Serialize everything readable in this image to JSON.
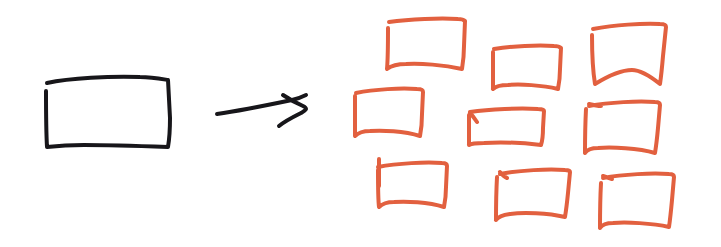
{
  "canvas": {
    "width": 721,
    "height": 247,
    "background_color": "#ffffff",
    "style": "hand-drawn-sketch",
    "title": "One box transforms into nine boxes"
  },
  "palette": {
    "ink_black": "#17161a",
    "ink_orange": "#e2603f"
  },
  "source_shape": {
    "label": "single hand-drawn rectangle",
    "color": "#17161a",
    "stroke_width": 4,
    "x": 45,
    "y": 76,
    "width": 125,
    "height": 72,
    "path": "M47 83 C70 78 110 76 140 77 C152 77 162 79 168 80 L170 118 C170 132 169 141 168 147 C140 146 104 145 84 145 C70 145 56 146 47 147 M46 91 C46 112 46 130 47 147"
  },
  "arrow": {
    "label": "transformation arrow",
    "color": "#17161a",
    "stroke_width": 4,
    "direction": "right",
    "x": 216,
    "y": 95,
    "width": 91,
    "height": 31,
    "shaft_path": "M217 114 C238 111 268 105 292 100 C297 99 302 97 306 95",
    "head_path": "M283 95 C289 99 296 103 303 106 C305 107 306 108 306 109 C306 110 304 111 301 113 C293 117 285 121 279 126"
  },
  "result_shapes": {
    "label": "nine hand-drawn rectangles",
    "color": "#e2603f",
    "stroke_width": 4,
    "count": 9,
    "grid": {
      "rows": 3,
      "columns": 3
    },
    "boxes": [
      {
        "id": "box-1",
        "row": 1,
        "column": 1,
        "x": 385,
        "y": 17,
        "width": 82,
        "height": 53,
        "path": "M389 22 C410 19 440 18 458 19 C462 19 464 20 465 21 L464 46 C464 56 463 63 462 69 C444 65 420 63 406 64 C398 64 391 66 387 69 M388 28 C388 44 388 58 387 69"
      },
      {
        "id": "box-2",
        "row": 1,
        "column": 2,
        "x": 492,
        "y": 43,
        "width": 70,
        "height": 47,
        "path": "M494 49 C512 46 538 45 554 46 C558 46 560 47 561 48 L560 69 C560 78 559 84 558 89 C542 85 520 84 508 85 C501 85 496 86 493 89 M493 52 C493 67 493 80 493 89"
      },
      {
        "id": "box-3",
        "row": 1,
        "column": 3,
        "x": 589,
        "y": 22,
        "width": 78,
        "height": 63,
        "path": "M593 29 C614 25 643 23 660 24 C664 24 666 25 666 27 L663 56 C662 68 661 77 660 84 C650 76 640 70 632 70 C622 70 608 76 595 84 M592 35 C592 55 593 72 595 84"
      },
      {
        "id": "box-4",
        "row": 2,
        "column": 1,
        "x": 353,
        "y": 87,
        "width": 72,
        "height": 51,
        "path": "M356 93 C375 89 401 88 417 89 C421 89 423 90 423 92 L422 114 C422 124 421 131 420 136 C404 131 382 130 370 131 C363 131 358 133 355 136 M355 96 C355 112 355 127 355 136"
      },
      {
        "id": "box-5",
        "row": 2,
        "column": 2,
        "x": 467,
        "y": 106,
        "width": 78,
        "height": 41,
        "path": "M470 112 C490 109 520 108 538 109 C542 109 544 110 544 111 L543 128 C543 136 542 142 541 145 C524 143 498 142 484 143 C477 143 472 143 469 145 M469 115 C469 128 469 139 469 145 M470 113 C473 116 475 119 477 122"
      },
      {
        "id": "box-6",
        "row": 2,
        "column": 3,
        "x": 585,
        "y": 99,
        "width": 76,
        "height": 56,
        "path": "M589 106 C610 102 638 101 655 102 C658 102 660 103 660 105 L658 128 C657 139 656 147 655 153 C638 148 612 147 598 148 C591 148 587 150 585 153 M586 109 C585 128 585 143 585 153 M589 104 C593 105 597 106 601 106"
      },
      {
        "id": "box-7",
        "row": 3,
        "column": 1,
        "x": 374,
        "y": 158,
        "width": 74,
        "height": 50,
        "path": "M378 167 C398 163 426 162 442 163 C445 163 447 164 447 166 L446 187 C446 196 445 202 444 207 C428 202 406 201 394 202 C387 202 382 204 379 207 M378 170 C378 186 378 199 379 207 M379 159 C379 168 379 177 379 186"
      },
      {
        "id": "box-8",
        "row": 3,
        "column": 2,
        "x": 494,
        "y": 167,
        "width": 77,
        "height": 55,
        "path": "M500 174 C520 170 548 169 565 170 C568 170 570 171 570 172 L568 193 C567 203 566 211 565 217 C548 213 523 212 510 214 C503 215 498 217 496 220 M497 177 C496 195 496 209 496 220 M500 172 C502 175 504 177 507 178"
      },
      {
        "id": "box-9",
        "row": 3,
        "column": 3,
        "x": 599,
        "y": 171,
        "width": 77,
        "height": 59,
        "path": "M603 178 C624 174 652 173 669 174 C672 174 674 175 674 177 L672 200 C671 211 670 220 669 227 C652 223 626 222 613 223 C606 223 602 225 600 228 M601 183 C600 201 600 216 600 228 M603 176 C606 177 609 178 612 179"
      }
    ]
  },
  "accessibility": {
    "alt_text": "A hand-drawn sketch: a single black rectangle on the left, an arrow pointing right, and nine orange rectangles arranged in a three-by-three grid on the right."
  }
}
